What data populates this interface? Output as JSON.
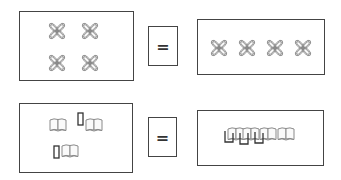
{
  "rows": [
    {
      "left_items": [
        "flower-icon",
        "flower-icon",
        "flower-icon",
        "flower-icon"
      ],
      "operator": "=",
      "right_items": [
        "flower-icon",
        "flower-icon",
        "flower-icon",
        "flower-icon"
      ]
    },
    {
      "left_items": [
        "book-icon",
        "phone-icon",
        "book-icon",
        "phone-icon",
        "book-icon"
      ],
      "operator": "=",
      "right_items": [
        "book-icon",
        "phone-icon",
        "book-icon",
        "phone-icon",
        "book-icon",
        "phone-icon",
        "book-icon"
      ]
    }
  ],
  "colors": {
    "border": "#444444",
    "icon_stroke": "#8a8a8a",
    "phone_stroke": "#333333"
  }
}
